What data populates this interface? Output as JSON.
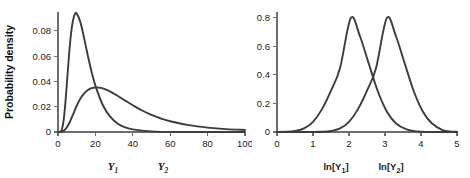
{
  "figure": {
    "background": "#ffffff",
    "curve_color": "#3c3c3c",
    "axis_color": "#6e6e6e",
    "text_color": "#1a1a1a"
  },
  "chart_data": [
    {
      "type": "line",
      "panel": "left",
      "title": "",
      "xlabel": "",
      "ylabel": "Probability density",
      "xlim": [
        0,
        100
      ],
      "ylim": [
        0,
        0.095
      ],
      "grid": false,
      "legend_position": "below-axis",
      "xticks": [
        0,
        20,
        40,
        60,
        80,
        100
      ],
      "xticklabels": [
        "0",
        "20",
        "40",
        "60",
        "80",
        "100"
      ],
      "yticks": [
        0,
        0.02,
        0.04,
        0.06,
        0.08
      ],
      "yticklabels": [
        "0",
        "0.02",
        "0.04",
        "0.06",
        "0.08"
      ],
      "series": [
        {
          "name": "Y1",
          "label_text": "Y",
          "label_sub": "1",
          "distribution": "lognormal",
          "meanlog": 2.3,
          "sdlog": 0.45,
          "peak_x": 8.2,
          "peak_y": 0.0935,
          "x": [
            0,
            1,
            2,
            3,
            4,
            5,
            6,
            7,
            8,
            9,
            10,
            12,
            14,
            16,
            18,
            20,
            24,
            28,
            32,
            36,
            40,
            50,
            60,
            80,
            100
          ],
          "y": [
            0,
            0.0001,
            0.0018,
            0.0091,
            0.0238,
            0.0434,
            0.0627,
            0.0782,
            0.0883,
            0.0932,
            0.0938,
            0.0868,
            0.0741,
            0.0601,
            0.0474,
            0.0367,
            0.0212,
            0.0119,
            0.0066,
            0.0037,
            0.0021,
            0.0005,
            0.0001,
            0,
            0
          ]
        },
        {
          "name": "Y2",
          "label_text": "Y",
          "label_sub": "2",
          "distribution": "lognormal",
          "meanlog": 3.15,
          "sdlog": 0.62,
          "peak_x": 21.0,
          "peak_y": 0.0353,
          "x": [
            0,
            2,
            4,
            6,
            8,
            10,
            12,
            14,
            16,
            18,
            20,
            22,
            25,
            28,
            32,
            36,
            40,
            45,
            50,
            55,
            60,
            70,
            80,
            90,
            100
          ],
          "y": [
            0,
            0.0002,
            0.0022,
            0.0069,
            0.0137,
            0.0208,
            0.0265,
            0.0306,
            0.0332,
            0.0347,
            0.0352,
            0.0351,
            0.034,
            0.032,
            0.0285,
            0.0248,
            0.0212,
            0.017,
            0.0135,
            0.0107,
            0.0085,
            0.0054,
            0.0035,
            0.0023,
            0.0016
          ]
        }
      ]
    },
    {
      "type": "line",
      "panel": "right",
      "title": "",
      "xlabel": "",
      "ylabel": "",
      "xlim": [
        0,
        5
      ],
      "ylim": [
        0,
        0.84
      ],
      "grid": false,
      "legend_position": "below-axis",
      "xticks": [
        0,
        1,
        2,
        3,
        4,
        5
      ],
      "xticklabels": [
        "0",
        "1",
        "2",
        "3",
        "4",
        "5"
      ],
      "yticks": [
        0,
        0.2,
        0.4,
        0.6,
        0.8
      ],
      "yticklabels": [
        "0",
        "0.2",
        "0.4",
        "0.6",
        "0.8"
      ],
      "series": [
        {
          "name": "ln[Y1]",
          "label_text": "ln[Y",
          "label_sub": "1",
          "label_tail": "]",
          "distribution": "normal",
          "mean": 2.05,
          "sd": 0.5,
          "peak_x": 2.05,
          "peak_y": 0.8,
          "x": [
            0,
            0.25,
            0.5,
            0.75,
            1.0,
            1.25,
            1.5,
            1.75,
            2.05,
            2.3,
            2.55,
            2.8,
            3.05,
            3.3,
            3.6,
            3.9,
            4.2,
            4.5,
            5.0
          ],
          "y": [
            0.0003,
            0.0016,
            0.0072,
            0.0254,
            0.0713,
            0.1603,
            0.2897,
            0.4466,
            0.7979,
            0.6736,
            0.4779,
            0.2851,
            0.1436,
            0.0612,
            0.0179,
            0.0034,
            0.0004,
            3e-05,
            0
          ]
        },
        {
          "name": "ln[Y2]",
          "label_text": "ln[Y",
          "label_sub": "2",
          "label_tail": "]",
          "distribution": "normal",
          "mean": 3.05,
          "sd": 0.5,
          "peak_x": 3.05,
          "peak_y": 0.8,
          "x": [
            0,
            0.5,
            1.0,
            1.25,
            1.5,
            1.75,
            2.0,
            2.25,
            2.5,
            2.75,
            3.05,
            3.3,
            3.55,
            3.8,
            4.05,
            4.3,
            4.6,
            4.85,
            5.0
          ],
          "y": [
            0,
            3e-05,
            0.0004,
            0.0016,
            0.0072,
            0.0254,
            0.0713,
            0.1603,
            0.2897,
            0.4466,
            0.7979,
            0.6736,
            0.4779,
            0.2851,
            0.1436,
            0.0612,
            0.0133,
            0.0028,
            0.0012
          ]
        }
      ]
    }
  ]
}
